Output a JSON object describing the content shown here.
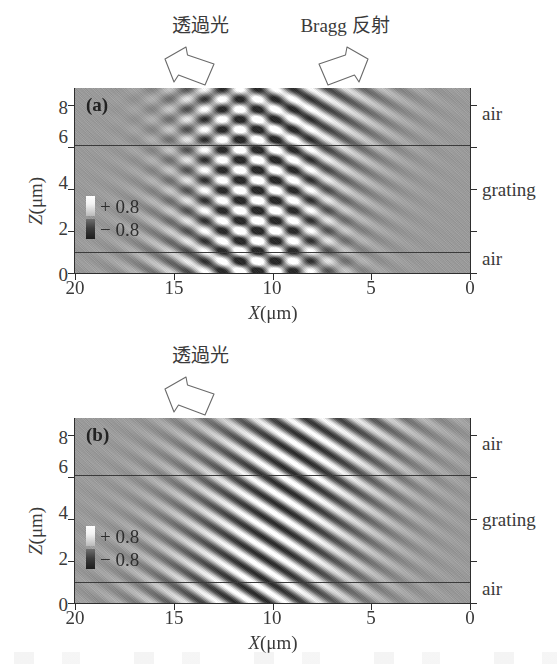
{
  "figure": {
    "panels": [
      {
        "id": "a",
        "letter": "(a)",
        "annotations": [
          {
            "name": "transmitted-light",
            "text": "透過光",
            "arrow": "block-arrow-up-left"
          },
          {
            "name": "bragg-reflection",
            "text": "Bragg 反射",
            "arrow": "block-arrow-up-right"
          }
        ],
        "region_labels": [
          "air",
          "grating",
          "air"
        ],
        "color_key": {
          "positive": "+ 0.8",
          "negative": "− 0.8"
        }
      },
      {
        "id": "b",
        "letter": "(b)",
        "annotations": [
          {
            "name": "transmitted-light",
            "text": "透過光",
            "arrow": "block-arrow-up-left"
          }
        ],
        "region_labels": [
          "air",
          "grating",
          "air"
        ],
        "color_key": {
          "positive": "+ 0.8",
          "negative": "− 0.8"
        }
      }
    ]
  },
  "axes": {
    "x_title_symbol": "X",
    "x_title_unit": "(μm)",
    "y_title_symbol": "Z",
    "y_title_unit": "(μm)",
    "x_ticks": [
      "20",
      "15",
      "10",
      "5",
      "0"
    ],
    "x_tick_values": [
      20,
      15,
      10,
      5,
      0
    ],
    "y_ticks": [
      "0",
      "2",
      "4",
      "6",
      "8"
    ],
    "y_tick_values": [
      0,
      2,
      4,
      6,
      8
    ],
    "x_range": [
      20,
      0
    ],
    "y_range": [
      0,
      8.8
    ]
  },
  "colors": {
    "background": "#ffffff",
    "field_midtone": "#9a9a9a",
    "axis": "#2e2e2e",
    "text": "#3a3a3a",
    "interface_line": "#3b3b3b"
  },
  "chart_data": {
    "type": "heatmap",
    "title": "",
    "xlabel": "X(μm)",
    "ylabel": "Z(μm)",
    "xlim": [
      20,
      0
    ],
    "ylim": [
      0,
      8.8
    ],
    "grid": false,
    "legend": "inset colour key",
    "colorbar": {
      "min": -0.8,
      "max": 0.8,
      "min_label": "− 0.8",
      "max_label": "+ 0.8",
      "colormap": "grayscale (black = negative, white = positive)"
    },
    "interfaces": [
      {
        "z": 6.0,
        "label": "air / grating boundary (upper)"
      },
      {
        "z": 1.0,
        "label": "grating / air boundary (lower)"
      }
    ],
    "regions": [
      {
        "name": "air",
        "z_from": 6.0,
        "z_to": 8.8
      },
      {
        "name": "grating",
        "z_from": 1.0,
        "z_to": 6.0
      },
      {
        "name": "air",
        "z_from": 0.0,
        "z_to": 1.0
      }
    ],
    "panels": [
      {
        "id": "a",
        "label": "(a)",
        "description": "Field amplitude map showing an incident/transmitted beam plus a Bragg-reflected beam; the two beams overlap near X≈10-12 μm producing a cross-hatched interference region.",
        "waves": [
          {
            "name": "transmitted",
            "amplitude": 0.8,
            "angle_deg": -28,
            "wavelength_um": 0.85,
            "center_x_um": 11.5,
            "beam_width_um": 6.5
          },
          {
            "name": "bragg-reflected",
            "amplitude": 0.55,
            "angle_deg": 28,
            "wavelength_um": 0.85,
            "center_x_um": 10.0,
            "beam_width_um": 4.0
          }
        ]
      },
      {
        "id": "b",
        "label": "(b)",
        "description": "Field amplitude map with only the transmitted beam; no Bragg reflection is present so a single family of tilted fringes crosses the grating.",
        "waves": [
          {
            "name": "transmitted",
            "amplitude": 0.8,
            "angle_deg": -30,
            "wavelength_um": 0.85,
            "center_x_um": 11.0,
            "beam_width_um": 7.5
          }
        ]
      }
    ]
  }
}
